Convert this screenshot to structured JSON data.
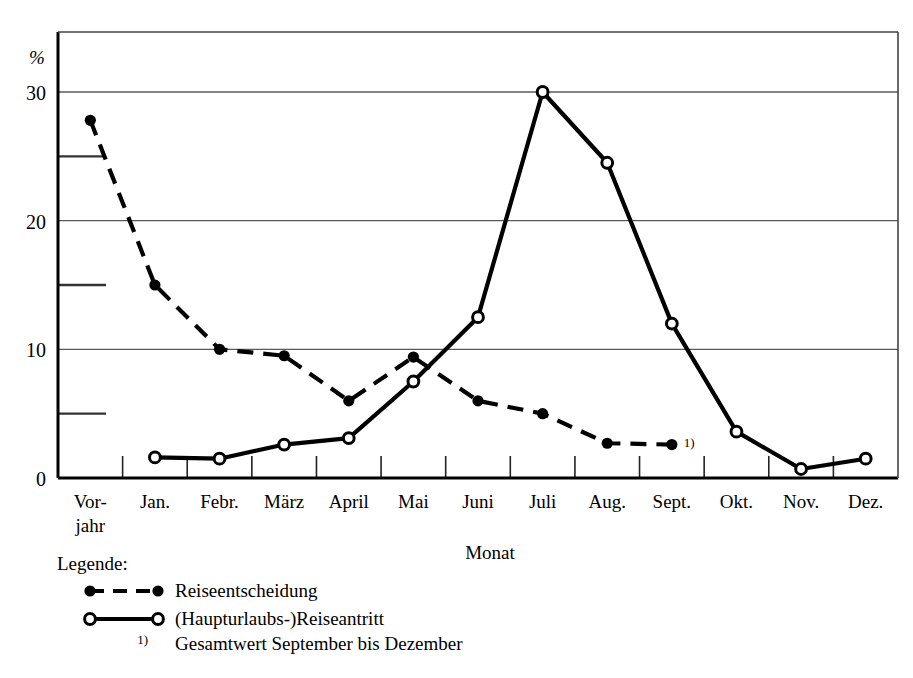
{
  "chart_data": {
    "type": "line",
    "title": "",
    "xlabel": "Monat",
    "ylabel": "%",
    "ylim": [
      0,
      33
    ],
    "yticks_major": [
      0,
      10,
      20,
      30
    ],
    "yticks_minor": [
      5,
      15,
      25
    ],
    "grid": "horizontal major gridlines only",
    "legend_position": "below plot, left",
    "categories": [
      "Vor-\njahr",
      "Jan.",
      "Febr.",
      "März",
      "April",
      "Mai",
      "Juni",
      "Juli",
      "Aug.",
      "Sept.",
      "Okt.",
      "Nov.",
      "Dez."
    ],
    "category_labels": [
      {
        "line1": "Vor-",
        "line2": "jahr"
      },
      {
        "line1": "Jan.",
        "line2": ""
      },
      {
        "line1": "Febr.",
        "line2": ""
      },
      {
        "line1": "März",
        "line2": ""
      },
      {
        "line1": "April",
        "line2": ""
      },
      {
        "line1": "Mai",
        "line2": ""
      },
      {
        "line1": "Juni",
        "line2": ""
      },
      {
        "line1": "Juli",
        "line2": ""
      },
      {
        "line1": "Aug.",
        "line2": ""
      },
      {
        "line1": "Sept.",
        "line2": ""
      },
      {
        "line1": "Okt.",
        "line2": ""
      },
      {
        "line1": "Nov.",
        "line2": ""
      },
      {
        "line1": "Dez.",
        "line2": ""
      }
    ],
    "series": [
      {
        "name": "Reiseentscheidung",
        "style": "dashed",
        "marker": "filled-circle",
        "color": "#000000",
        "x": [
          "Vorjahr",
          "Jan.",
          "Febr.",
          "März",
          "April",
          "Mai",
          "Juni",
          "Juli",
          "Aug.",
          "Sept."
        ],
        "values": [
          27.8,
          15.0,
          10.0,
          9.5,
          6.0,
          9.4,
          6.0,
          5.0,
          2.7,
          2.6
        ],
        "footnote_at_last_point": "1)"
      },
      {
        "name": "(Haupturlaubs-)Reiseantritt",
        "style": "solid",
        "marker": "open-circle",
        "color": "#000000",
        "x": [
          "Jan.",
          "Febr.",
          "März",
          "April",
          "Mai",
          "Juni",
          "Juli",
          "Aug.",
          "Sept.",
          "Okt.",
          "Nov.",
          "Dez."
        ],
        "values": [
          1.6,
          1.5,
          2.6,
          3.1,
          7.5,
          12.5,
          30.0,
          24.5,
          12.0,
          3.6,
          0.7,
          1.5
        ]
      }
    ],
    "annotations": [
      {
        "text": "1)",
        "near": "Sept. on Reiseentscheidung series"
      }
    ]
  },
  "axes": {
    "y_unit": "%",
    "y_tick_labels": [
      "30",
      "20",
      "10",
      "0"
    ],
    "x_title": "Monat"
  },
  "legend": {
    "title": "Legende:",
    "entries": [
      {
        "marker": "filled-circle",
        "line": "dashed",
        "label": "Reiseentscheidung"
      },
      {
        "marker": "open-circle",
        "line": "solid",
        "label": "(Haupturlaubs-)Reiseantritt"
      }
    ],
    "footnote": {
      "mark": "1)",
      "text": "Gesamtwert September bis Dezember"
    }
  },
  "colors": {
    "line": "#000000",
    "grid": "#5a5a5a",
    "axis": "#000000",
    "background": "#ffffff"
  }
}
